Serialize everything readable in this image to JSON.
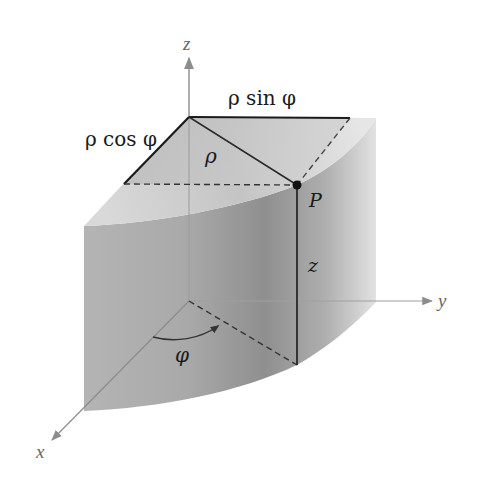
{
  "diagram": {
    "type": "3d-cylindrical-coordinates",
    "axes": {
      "x": {
        "label": "x"
      },
      "y": {
        "label": "y"
      },
      "z": {
        "label": "z"
      }
    },
    "point": {
      "label": "P"
    },
    "labels": {
      "rho": "ρ",
      "rho_sin_phi": "ρ sin φ",
      "rho_cos_phi": "ρ cos φ",
      "height": "z",
      "angle": "φ"
    },
    "colors": {
      "axis": "#8c8c8c",
      "edge": "#1a1a1a",
      "dash": "#333333",
      "surface_light": "#d6d6d6",
      "surface_mid": "#a8a8a8",
      "surface_dark": "#8e8e8e"
    }
  }
}
